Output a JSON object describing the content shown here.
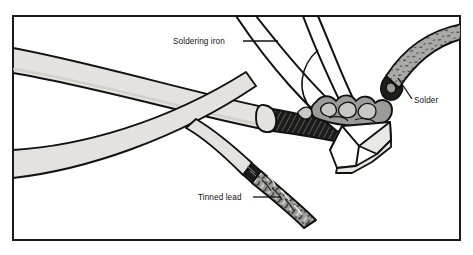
{
  "figure": {
    "frame": {
      "stroke_color": "#1a1a1a",
      "fill_color": "#ffffff"
    },
    "palette": {
      "outline": "#111111",
      "cable_jacket": "#e3e2de",
      "cable_jacket_shade": "#cfcec9",
      "braid_dark": "#1c1c1c",
      "solder_blob": "#9b9b97",
      "solder_blob_light": "#c8c8c4",
      "tinned_conductor": "#8f8f8b",
      "solder_wire": "#a9a9a5",
      "iron_tip_face": "#ffffff",
      "iron_tip_bevel": "#e8e8e4",
      "iron_body": "#fdfdfd",
      "label_color": "#111111"
    },
    "labels": [
      {
        "id": "soldering-iron",
        "text": "Soldering iron",
        "text_x": 173,
        "text_y": 44,
        "leader": {
          "x1": 243,
          "y1": 41,
          "x2": 278,
          "y2": 41
        }
      },
      {
        "id": "solder",
        "text": "Solder",
        "text_x": 414,
        "text_y": 103,
        "leader": {
          "x1": 412,
          "y1": 99,
          "x2": 398,
          "y2": 78
        }
      },
      {
        "id": "tinned-lead",
        "text": "Tinned lead",
        "text_x": 198,
        "text_y": 200,
        "leader": {
          "x1": 253,
          "y1": 197,
          "x2": 281,
          "y2": 197
        }
      }
    ],
    "parts": [
      {
        "id": "upper-cable",
        "name": "Coaxial cable (upper, stripped end)"
      },
      {
        "id": "lower-cable",
        "name": "Coaxial cable (lower, crossing)"
      },
      {
        "id": "braid-shield",
        "name": "Exposed braided shield"
      },
      {
        "id": "solder-blob",
        "name": "Molten solder joint"
      },
      {
        "id": "soldering-iron-body",
        "name": "Soldering iron shaft"
      },
      {
        "id": "soldering-iron-tip",
        "name": "Chisel soldering iron tip"
      },
      {
        "id": "solder-wire",
        "name": "Solder wire feed"
      },
      {
        "id": "tinned-lead-conductor",
        "name": "Tinned stranded lead"
      }
    ]
  }
}
